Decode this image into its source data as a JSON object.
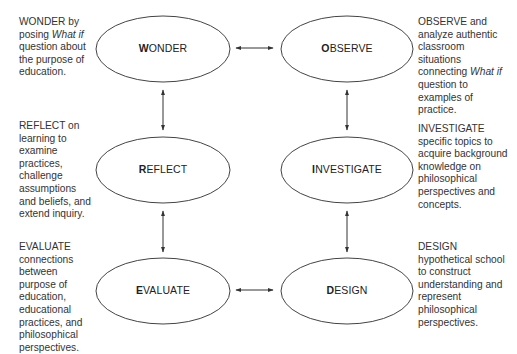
{
  "nodes": [
    {
      "id": "wonder",
      "first": "W",
      "rest": "ONDER",
      "cx": 163,
      "cy": 49
    },
    {
      "id": "observe",
      "first": "O",
      "rest": "BSERVE",
      "cx": 347,
      "cy": 49
    },
    {
      "id": "reflect",
      "first": "R",
      "rest": "EFLECT",
      "cx": 163,
      "cy": 170
    },
    {
      "id": "investigate",
      "first": "I",
      "rest": "NVESTIGATE",
      "cx": 347,
      "cy": 170
    },
    {
      "id": "evaluate",
      "first": "E",
      "rest": "VALUATE",
      "cx": 163,
      "cy": 291
    },
    {
      "id": "design",
      "first": "D",
      "rest": "ESIGN",
      "cx": 347,
      "cy": 291
    }
  ],
  "descriptions": {
    "wonder": {
      "lead": "WONDER by",
      "line2a": "posing ",
      "line2em": "What if",
      "rest": "question about the purpose of education."
    },
    "observe": {
      "lead": "OBSERVE and",
      "text1": "analyze authentic classroom situations connecting ",
      "em": "What if",
      "text2": " question to examples of practice."
    },
    "reflect": {
      "lead": "REFLECT on",
      "text": "learning to examine practices, challenge assumptions and beliefs, and extend inquiry."
    },
    "investigate": {
      "lead": "INVESTIGATE",
      "text": "specific topics to acquire background knowledge on philosophical perspectives and concepts."
    },
    "evaluate": {
      "lead": "EVALUATE",
      "text": "connections between purpose of education, educational practices, and philosophical perspectives."
    },
    "design": {
      "lead": "DESIGN",
      "text": "hypothetical school to construct understanding and represent philosophical perspectives."
    }
  },
  "connections": [
    {
      "from": "wonder",
      "to": "observe",
      "type": "bidirectional"
    },
    {
      "from": "observe",
      "to": "investigate",
      "type": "bidirectional"
    },
    {
      "from": "investigate",
      "to": "design",
      "type": "bidirectional"
    },
    {
      "from": "design",
      "to": "evaluate",
      "type": "bidirectional"
    },
    {
      "from": "evaluate",
      "to": "reflect",
      "type": "bidirectional"
    },
    {
      "from": "reflect",
      "to": "wonder",
      "type": "bidirectional"
    }
  ],
  "colors": {
    "stroke": "#333333",
    "text": "#2a2a2a",
    "background": "#ffffff"
  }
}
